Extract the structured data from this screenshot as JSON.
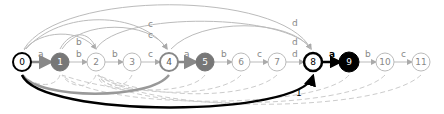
{
  "diagram": {
    "type": "automaton",
    "nodes": [
      {
        "id": "0",
        "x": 22,
        "y": 62,
        "style": "bold-outline"
      },
      {
        "id": "1",
        "x": 60,
        "y": 62,
        "style": "gray-filled"
      },
      {
        "id": "2",
        "x": 96,
        "y": 62,
        "style": "light"
      },
      {
        "id": "3",
        "x": 132,
        "y": 62,
        "style": "light"
      },
      {
        "id": "4",
        "x": 169,
        "y": 62,
        "style": "gray-outline"
      },
      {
        "id": "5",
        "x": 205,
        "y": 62,
        "style": "gray-filled"
      },
      {
        "id": "6",
        "x": 241,
        "y": 62,
        "style": "light"
      },
      {
        "id": "7",
        "x": 277,
        "y": 62,
        "style": "light"
      },
      {
        "id": "8",
        "x": 313,
        "y": 62,
        "style": "bold-outline"
      },
      {
        "id": "9",
        "x": 349,
        "y": 62,
        "style": "black-filled"
      },
      {
        "id": "10",
        "x": 385,
        "y": 62,
        "style": "light"
      },
      {
        "id": "11",
        "x": 421,
        "y": 62,
        "style": "light"
      }
    ],
    "edge_labels": {
      "0_1": "a",
      "1_2": "b",
      "0_2": "b",
      "2_3": "b",
      "3_4": "c",
      "top_c1": "c",
      "top_c2": "c",
      "4_5": "a",
      "5_6": "b",
      "6_7": "c",
      "7_8": "d",
      "top_d1": "d",
      "top_d2": "d",
      "8_9": "a",
      "8_9_weight": "1",
      "9_10": "b",
      "10_11": "c",
      "0_8_weight": "1"
    }
  }
}
